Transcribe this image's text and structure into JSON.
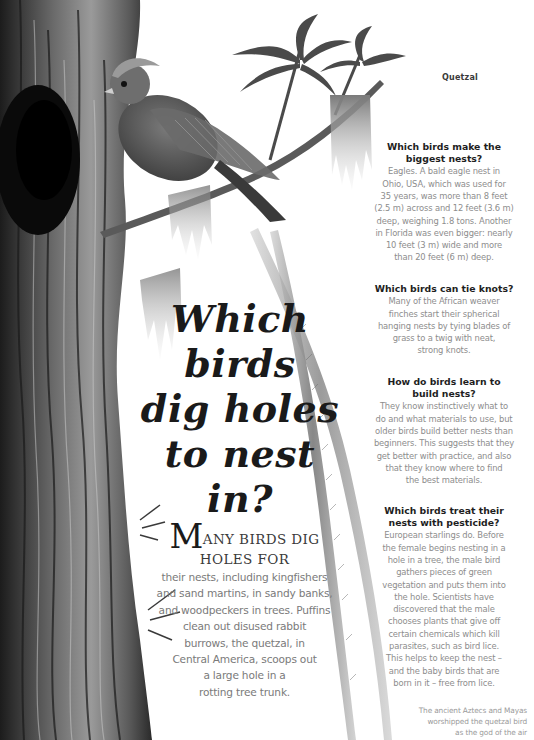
{
  "illustration": {
    "subject": "Quetzal perched on a branch beside a hollow tree trunk with nest hole, long tail feathers trailing down",
    "tree_color": "#3c3c3c",
    "bird_color": "#5b5b5b",
    "moss_color": "#9a9a9a"
  },
  "caption_top": "Quetzal",
  "title": {
    "lines": [
      "Which",
      "birds",
      "dig holes",
      "to nest",
      "in?"
    ]
  },
  "intro": {
    "dropcap": "M",
    "lead_lines": [
      "ANY BIRDS DIG",
      "HOLES FOR"
    ],
    "body_lines": [
      "their nests, including kingfishers",
      "and sand martins, in sandy banks,",
      "and woodpeckers in trees. Puffins",
      "clean out disused rabbit",
      "burrows, the quetzal, in",
      "Central America, scoops out",
      "a large hole in a",
      "rotting tree trunk."
    ]
  },
  "qa": [
    {
      "question_lines": [
        "Which birds make the",
        "biggest nests?"
      ],
      "answer_lines": [
        "Eagles. A bald eagle nest in",
        "Ohio, USA, which was used for",
        "35 years, was more than 8 feet",
        "(2.5 m) across and 12 feet (3.6 m)",
        "deep, weighing 1.8 tons. Another",
        "in Florida was even bigger: nearly",
        "10 feet (3 m) wide and more",
        "than 20 feet (6 m) deep."
      ]
    },
    {
      "question_lines": [
        "Which birds can tie knots?"
      ],
      "answer_lines": [
        "Many of the African weaver",
        "finches start their spherical",
        "hanging nests by tying blades of",
        "grass to a twig with neat,",
        "strong knots."
      ]
    },
    {
      "question_lines": [
        "How do birds learn to",
        "build nests?"
      ],
      "answer_lines": [
        "They know instinctively what to",
        "do and what materials to use, but",
        "older birds build better nests than",
        "beginners. This suggests that they",
        "get better with practice, and also",
        "that they know where to find",
        "the best materials."
      ]
    },
    {
      "question_lines": [
        "Which birds treat their",
        "nests with pesticide?"
      ],
      "answer_lines": [
        "European starlings do. Before",
        "the female begins nesting in a",
        "hole in a tree, the male bird",
        "gathers pieces of green",
        "vegetation and puts them into",
        "the hole. Scientists have",
        "discovered that the male",
        "chooses plants that give off",
        "certain chemicals which kill",
        "parasites, such as bird lice.",
        "This helps to keep the nest –",
        "and the baby birds that are",
        "born in it – free from lice."
      ]
    }
  ],
  "caption_bottom_lines": [
    "The ancient Aztecs and Mayas",
    "worshipped the quetzal bird",
    "as the god of the air"
  ]
}
